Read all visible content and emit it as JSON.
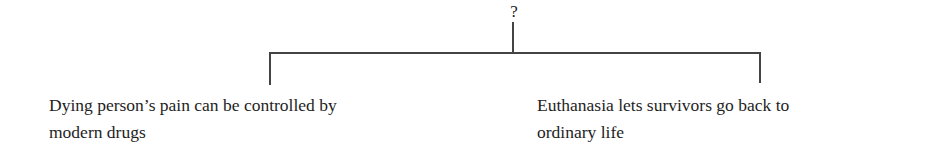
{
  "diagram": {
    "root_label": "?",
    "children": [
      {
        "lines": [
          "Dying person’s pain can be controlled by",
          "modern drugs"
        ]
      },
      {
        "lines": [
          "Euthanasia lets survivors go back to",
          "ordinary life"
        ]
      }
    ]
  }
}
